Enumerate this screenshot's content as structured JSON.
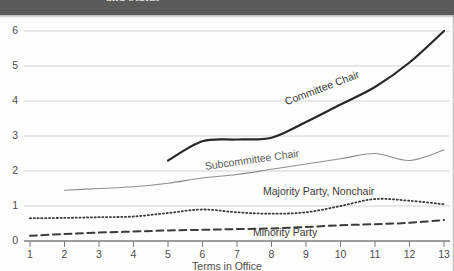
{
  "figure": {
    "header_caption": "and Status",
    "header_band_color": "#5a5a58",
    "background_color": "#fdfdfc",
    "ink_color": "#3b3b39",
    "grid_color": "#d3d3d1"
  },
  "chart_data": {
    "type": "line",
    "title": "and Status",
    "xlabel": "Terms in Office",
    "ylabel": "",
    "xlim": [
      1,
      13
    ],
    "ylim": [
      0,
      6
    ],
    "xticks": [
      1,
      2,
      3,
      4,
      5,
      6,
      7,
      8,
      9,
      10,
      11,
      12,
      13
    ],
    "yticks": [
      0,
      1,
      2,
      3,
      4,
      5,
      6
    ],
    "grid": "horizontal",
    "legend": "inline-labels",
    "series": [
      {
        "name": "Committee Chair",
        "style": "solid-thick",
        "color": "#27272a",
        "label_position": {
          "x": 283,
          "y": 96,
          "rotate": -21
        },
        "x": [
          5,
          6,
          7,
          8,
          9,
          10,
          11,
          12,
          13
        ],
        "values": [
          2.3,
          2.85,
          2.9,
          2.95,
          3.4,
          3.9,
          4.4,
          5.1,
          6.0
        ]
      },
      {
        "name": "Subcommittee Chair",
        "style": "solid-thin",
        "color": "#8f8f8d",
        "label_position": {
          "x": 204,
          "y": 160,
          "rotate": -8
        },
        "x": [
          2,
          3,
          4,
          5,
          6,
          7,
          8,
          9,
          10,
          11,
          12,
          13
        ],
        "values": [
          1.45,
          1.5,
          1.55,
          1.65,
          1.8,
          1.9,
          2.05,
          2.2,
          2.35,
          2.5,
          2.3,
          2.6
        ]
      },
      {
        "name": "Majority Party, Nonchair",
        "style": "dotted",
        "color": "#3b3b39",
        "label_position": {
          "x": 263,
          "y": 185,
          "rotate": 0
        },
        "x": [
          1,
          2,
          3,
          4,
          5,
          6,
          7,
          8,
          9,
          10,
          11,
          12,
          13
        ],
        "values": [
          0.65,
          0.66,
          0.68,
          0.7,
          0.8,
          0.9,
          0.82,
          0.78,
          0.82,
          1.0,
          1.2,
          1.15,
          1.05
        ]
      },
      {
        "name": "Minority Party",
        "style": "dashed",
        "color": "#3b3b39",
        "label_position": {
          "x": 253,
          "y": 226,
          "rotate": 0
        },
        "x": [
          1,
          2,
          3,
          4,
          5,
          6,
          7,
          8,
          9,
          10,
          11,
          12,
          13
        ],
        "values": [
          0.15,
          0.2,
          0.24,
          0.27,
          0.3,
          0.32,
          0.34,
          0.36,
          0.4,
          0.45,
          0.48,
          0.52,
          0.6
        ]
      }
    ]
  },
  "axis": {
    "y_labels": [
      "6",
      "5",
      "4",
      "3",
      "2",
      "1",
      "0"
    ],
    "x_labels": [
      "1",
      "2",
      "3",
      "4",
      "5",
      "6",
      "7",
      "8",
      "9",
      "10",
      "11",
      "12",
      "13"
    ],
    "x_title": "Terms in Office"
  },
  "series_labels": {
    "committee_chair": "Committee Chair",
    "subcommittee_chair": "Subcommittee Chair",
    "majority_party_nonchair": "Majority Party, Nonchair",
    "minority_party": "Minority Party"
  }
}
